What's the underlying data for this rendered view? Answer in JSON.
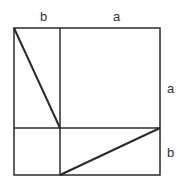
{
  "diagram": {
    "title": "",
    "type": "geometric-proof-square",
    "stroke_color": "#2a2a2a",
    "label_color": "#333333",
    "labels": {
      "top_left": "b",
      "top_right": "a",
      "right_upper": "a",
      "right_lower": "b"
    },
    "geometry": {
      "outer_square": {
        "x1": 14,
        "y1": 28,
        "x2": 160,
        "y2": 175
      },
      "vertical_divider_x": 60,
      "horizontal_divider_y": 128,
      "diagonals": [
        {
          "from": [
            14,
            28
          ],
          "to": [
            60,
            128
          ]
        },
        {
          "from": [
            60,
            175
          ],
          "to": [
            160,
            128
          ]
        }
      ]
    }
  }
}
